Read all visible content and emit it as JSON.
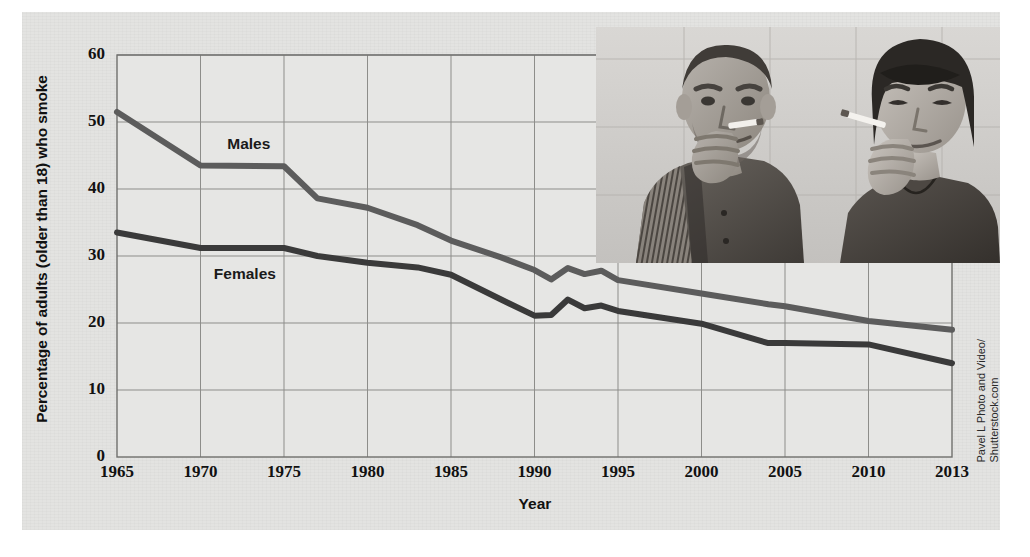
{
  "figure": {
    "background_color": "#e3e3e1",
    "credit": "Pavel L Photo and Video/ Shutterstock.com",
    "credit_line1": "Pavel L Photo and Video/",
    "credit_line2": "Shutterstock.com",
    "photo_alt": "Black and white photograph of a young man and a young woman each smoking a cigarette"
  },
  "chart_data": {
    "type": "line",
    "title": "",
    "xlabel": "Year",
    "ylabel": "Percentage of adults (older than 18) who smoke",
    "xlim": [
      1965,
      2013
    ],
    "ylim": [
      0,
      60
    ],
    "grid": true,
    "legend_position": "inline-labels",
    "xticks": [
      "1965",
      "1970",
      "1975",
      "1980",
      "1985",
      "1990",
      "1995",
      "2000",
      "2005",
      "2010",
      "2013"
    ],
    "xtick_values": [
      1965,
      1970,
      1975,
      1980,
      1985,
      1990,
      1995,
      2000,
      2005,
      2010,
      2013
    ],
    "yticks": [
      "0",
      "10",
      "20",
      "30",
      "40",
      "50",
      "60"
    ],
    "ytick_values": [
      0,
      10,
      20,
      30,
      40,
      50,
      60
    ],
    "series": [
      {
        "name": "Males",
        "color": "#5c5c5c",
        "label_x": 1971.6,
        "label_y": 46.5,
        "x": [
          1965,
          1970,
          1975,
          1977,
          1980,
          1983,
          1985,
          1988,
          1990,
          1991,
          1992,
          1993,
          1994,
          1995,
          2000,
          2004,
          2005,
          2010,
          2013
        ],
        "values": [
          51.5,
          43.5,
          43.4,
          38.6,
          37.2,
          34.6,
          32.3,
          29.8,
          27.9,
          26.5,
          28.2,
          27.3,
          27.8,
          26.4,
          24.4,
          22.8,
          22.5,
          20.3,
          19.0
        ]
      },
      {
        "name": "Females",
        "color": "#3a3a3a",
        "label_x": 1970.8,
        "label_y": 27.2,
        "x": [
          1965,
          1970,
          1975,
          1977,
          1980,
          1983,
          1985,
          1988,
          1990,
          1991,
          1992,
          1993,
          1994,
          1995,
          2000,
          2004,
          2005,
          2010,
          2013
        ],
        "values": [
          33.5,
          31.2,
          31.2,
          30.0,
          29.0,
          28.3,
          27.2,
          23.5,
          21.1,
          21.2,
          23.5,
          22.2,
          22.6,
          21.8,
          19.9,
          17.0,
          17.0,
          16.8,
          14.0
        ]
      }
    ]
  }
}
